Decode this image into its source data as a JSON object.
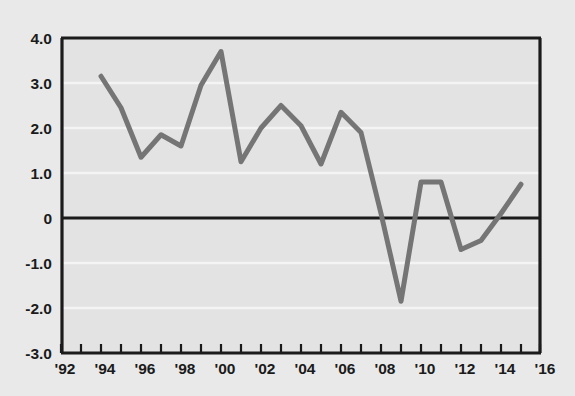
{
  "figure": {
    "top_clipped_text": "",
    "background_color": "#e9e9e9",
    "plot_background_color": "#e3e3e3",
    "axis_color": "#1b1b1b",
    "gridline_color": "#f4f4f4",
    "line_color": "#757575"
  },
  "chart_data": {
    "type": "line",
    "title": "",
    "subtitle": "",
    "xlabel": "",
    "ylabel": "",
    "xlim": [
      1992,
      2016
    ],
    "ylim": [
      -3.0,
      4.0
    ],
    "grid": true,
    "legend": "none",
    "y_ticks": [
      4.0,
      3.0,
      2.0,
      1.0,
      0,
      -1.0,
      -2.0,
      -3.0
    ],
    "y_tick_labels": [
      "4.0",
      "3.0",
      "2.0",
      "1.0",
      "0",
      "-1.0",
      "-2.0",
      "-3.0"
    ],
    "x_ticks": [
      1992,
      1993,
      1994,
      1995,
      1996,
      1997,
      1998,
      1999,
      2000,
      2001,
      2002,
      2003,
      2004,
      2005,
      2006,
      2007,
      2008,
      2009,
      2010,
      2011,
      2012,
      2013,
      2014,
      2015,
      2016
    ],
    "x_tick_labels": [
      "'92",
      "",
      "'94",
      "",
      "'96",
      "",
      "'98",
      "",
      "'00",
      "",
      "'02",
      "",
      "'04",
      "",
      "'06",
      "",
      "'08",
      "",
      "'10",
      "",
      "'12",
      "",
      "'14",
      "",
      "'16"
    ],
    "x_labeled_ticks": [
      1992,
      1994,
      1996,
      1998,
      2000,
      2002,
      2004,
      2006,
      2008,
      2010,
      2012,
      2014,
      2016
    ],
    "x_labeled_values": [
      "'92",
      "'94",
      "'96",
      "'98",
      "'00",
      "'02",
      "'04",
      "'06",
      "'08",
      "'10",
      "'12",
      "'14",
      "'16"
    ],
    "zero_line": 0,
    "series": [
      {
        "name": "series-1",
        "color": "#757575",
        "x": [
          1994,
          1995,
          1996,
          1997,
          1998,
          1999,
          2000,
          2001,
          2002,
          2003,
          2004,
          2005,
          2006,
          2007,
          2008,
          2009,
          2010,
          2011,
          2012,
          2013,
          2014,
          2015
        ],
        "values": [
          3.15,
          2.45,
          1.35,
          1.85,
          1.6,
          2.95,
          3.7,
          1.25,
          2.0,
          2.5,
          2.05,
          1.2,
          2.35,
          1.9,
          0.1,
          -1.85,
          0.8,
          0.8,
          -0.7,
          -0.5,
          0.1,
          0.75
        ]
      }
    ]
  }
}
